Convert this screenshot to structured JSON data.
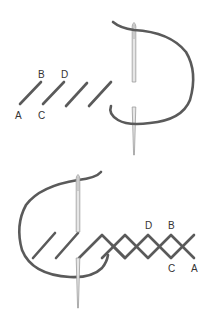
{
  "diagram": {
    "colors": {
      "thread": "#5a5a5a",
      "needle_fill": "#e6e6e6",
      "needle_stroke": "#9a9a9a",
      "label": "#333333",
      "background": "#ffffff"
    },
    "step1": {
      "description": "Slanted running stitches with needle passing thread",
      "labels": {
        "a": "A",
        "b": "B",
        "c": "C",
        "d": "D"
      }
    },
    "step2": {
      "description": "Crossed herringbone stitches worked back with needle",
      "labels": {
        "a": "A",
        "b": "B",
        "c": "C",
        "d": "D"
      }
    }
  }
}
